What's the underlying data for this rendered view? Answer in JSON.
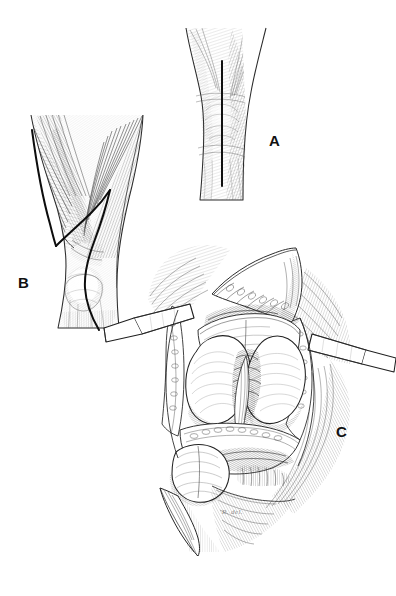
{
  "figure": {
    "kind": "medical-illustration",
    "technique": "pen-and-ink line engraving",
    "background_color": "#ffffff",
    "ink_color": "#1a1a1a",
    "hatch_color": "#4a4a4a",
    "width": 396,
    "height": 596,
    "panel_count": 3
  },
  "panels": [
    {
      "id": "a",
      "label": "A",
      "label_x": 269,
      "label_y": 133,
      "title": "Anterior knee with planned midline skin incision",
      "view": "anterior",
      "content": "Flexed knee seen from the front with a straight vertical midline skin incision marked over the patella.",
      "markings": [
        "vertical midline skin incision"
      ]
    },
    {
      "id": "b",
      "label": "B",
      "label_x": 18,
      "label_y": 275,
      "title": "Exposed extensor mechanism with arthrotomy line",
      "view": "anterior, skin reflected",
      "content": "Quadriceps tendon, vastus medialis and vastus lateralis exposed; a curved line marks the medial parapatellar arthrotomy passing medial to the patella and patellar tendon.",
      "markings": [
        "medial parapatellar arthrotomy line",
        "vastus medialis oblique",
        "quadriceps tendon",
        "patella outline",
        "patellar tendon"
      ]
    },
    {
      "id": "c",
      "label": "C",
      "label_x": 336,
      "label_y": 424,
      "title": "Knee joint exposed with patella everted and retractors in place",
      "view": "anterior, joint opened",
      "content": "Capsule reflected, patella everted laterally-inferiorly, two flat retractor blades holding the soft tissues; the medial and lateral femoral condyles and the intercondylar notch with cruciate ligament are visible.",
      "markings": [
        "medial femoral condyle",
        "lateral femoral condyle",
        "intercondylar notch",
        "anterior cruciate ligament",
        "everted patella",
        "tibial plateau",
        "retractor blade left",
        "retractor blade right",
        "reflected capsule flap",
        "fat pad"
      ]
    }
  ],
  "signature": {
    "text": "R. del.",
    "visible": true,
    "x": 222,
    "y": 508
  }
}
